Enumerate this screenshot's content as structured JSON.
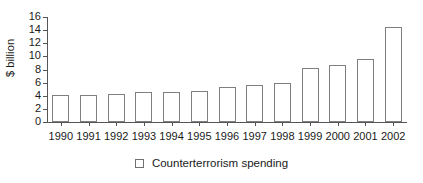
{
  "chart_data": {
    "type": "bar",
    "title": "",
    "subtitle": "",
    "xlabel": "",
    "ylabel": "$ billion",
    "ylim": [
      0,
      16
    ],
    "ytick_step": 2,
    "yticks": [
      0,
      2,
      4,
      6,
      8,
      10,
      12,
      14,
      16
    ],
    "grid": false,
    "legend_position": "bottom-center",
    "categories": [
      "1990",
      "1991",
      "1992",
      "1993",
      "1994",
      "1995",
      "1996",
      "1997",
      "1998",
      "1999",
      "2000",
      "2001",
      "2002"
    ],
    "series": [
      {
        "name": "Counterterrorism spending",
        "values": [
          4.1,
          4.1,
          4.2,
          4.5,
          4.5,
          4.7,
          5.3,
          5.6,
          6.0,
          8.3,
          8.7,
          9.6,
          14.5
        ]
      }
    ],
    "bar_style": {
      "fill": "#ffffff",
      "stroke": "#808080"
    },
    "axis_color": "#555555",
    "text_color": "#1a1a1a"
  },
  "legend": {
    "items": [
      {
        "label": "Counterterrorism spending",
        "swatch": "legend-swatch-open-square"
      }
    ]
  }
}
